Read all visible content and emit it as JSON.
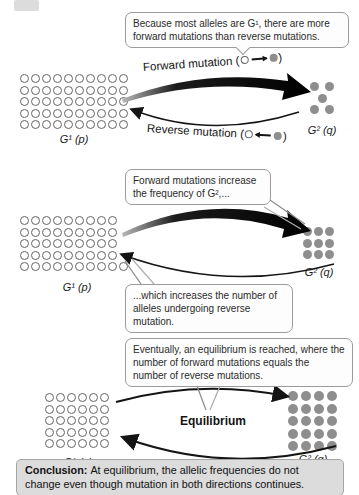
{
  "figure": {
    "panels": [
      {
        "callout_forward_bias": "Because most alleles are G¹, there are more forward mutations than reverse mutations.",
        "forward_label": {
          "prefix": "Forward mutation (",
          "suffix": ")",
          "icon": "open-circle-to-filled-dot"
        },
        "reverse_label": {
          "prefix": "Reverse mutation (",
          "suffix": ")",
          "icon": "filled-dot-to-open-circle"
        },
        "g1_label": "G¹ (p)",
        "g2_label": "G² (q)",
        "left_grid": {
          "type": "open",
          "rows": [
            10,
            10,
            10,
            10,
            10
          ]
        },
        "right_grid": {
          "type": "filled",
          "rows": [
            2,
            1,
            2
          ],
          "align": "center",
          "gap": 6
        }
      },
      {
        "callout_forward_increase": "Forward mutations increase the frequency of G²,...",
        "callout_reverse_increase": "...which increases the number of alleles undergoing reverse mutation.",
        "g1_label": "G¹ (p)",
        "g2_label": "G² (q)",
        "left_grid": {
          "type": "open",
          "rows": [
            9,
            9,
            9,
            9,
            10
          ]
        },
        "right_grid": {
          "type": "filled",
          "rows": [
            3,
            3,
            3
          ]
        }
      },
      {
        "callout_equilibrium": "Eventually, an equilibrium is reached, where the number of forward mutations equals the number of reverse mutations.",
        "equilibrium_label": "Equilibrium",
        "g1_label": "G¹ (p)",
        "g2_label": "G² (q)",
        "left_grid": {
          "type": "open",
          "rows": [
            6,
            6,
            6,
            6,
            6
          ]
        },
        "right_grid": {
          "type": "filled",
          "rows": [
            4,
            4,
            4,
            4,
            4
          ],
          "size": 10,
          "gap": 3
        }
      }
    ],
    "conclusion": {
      "bold": "Conclusion:",
      "text": "At equilibrium, the allelic frequencies do not change even though mutation in both directions continues."
    },
    "colors": {
      "open_circle_border": "#646464",
      "filled_dot": "#8e8e8e",
      "arrow": "#141414",
      "callout_border": "#9b9b9b",
      "callout_bg": "#fdfdfd",
      "conclusion_bg": "#dcdcdc",
      "pointer_line": "#9a9a9a"
    }
  }
}
